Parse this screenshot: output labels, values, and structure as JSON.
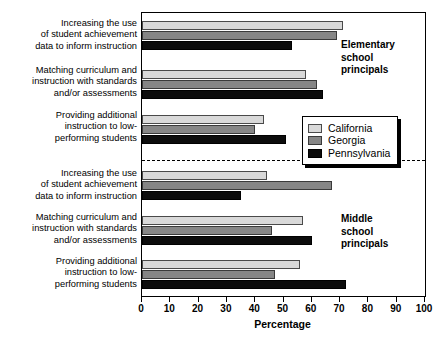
{
  "chart_data": {
    "type": "bar",
    "orientation": "horizontal",
    "title": "",
    "xlabel": "Percentage",
    "ylabel": "",
    "xlim": [
      0,
      100
    ],
    "xticks": [
      0,
      10,
      20,
      30,
      40,
      50,
      60,
      70,
      80,
      90,
      100
    ],
    "grid": false,
    "legend_position": "middle-right",
    "legend_entries": [
      "California",
      "Georgia",
      "Pennsylvania"
    ],
    "series": [
      {
        "name": "California",
        "color": "#d9d9d9",
        "values": [
          71,
          58,
          43,
          44,
          57,
          56
        ]
      },
      {
        "name": "Georgia",
        "color": "#868686",
        "values": [
          69,
          62,
          40,
          67,
          46,
          47
        ]
      },
      {
        "name": "Pennsylvania",
        "color": "#0c0c0c",
        "values": [
          53,
          64,
          51,
          35,
          60,
          72
        ]
      }
    ],
    "panels": [
      {
        "annotation": "Elementary school principals",
        "categories": [
          "Increasing the use of student achievement data to inform instruction",
          "Matching curriculum and instruction with standards and/or assessments",
          "Providing additional instruction to low-performing students"
        ]
      },
      {
        "annotation": "Middle school principals",
        "categories": [
          "Increasing the use of student achievement data to inform instruction",
          "Matching curriculum and instruction with standards and/or assessments",
          "Providing additional instruction to low-performing students"
        ]
      }
    ],
    "categories": [
      "Increasing the use of student achievement data to inform instruction",
      "Matching curriculum and instruction with standards and/or assessments",
      "Providing additional instruction to low-performing students",
      "Increasing the use of student achievement data to inform instruction",
      "Matching curriculum and instruction with standards and/or assessments",
      "Providing additional instruction to low-performing students"
    ]
  },
  "labels": {
    "cat1_line1": "Increasing the use",
    "cat1_line2": "of student achievement",
    "cat1_line3": "data to inform instruction",
    "cat2_line1": "Matching curriculum and",
    "cat2_line2": "instruction with standards",
    "cat2_line3": "and/or assessments",
    "cat3_line1": "Providing additional",
    "cat3_line2": "instruction to low-",
    "cat3_line3": "performing students",
    "cat4_line1": "Increasing the use",
    "cat4_line2": "of student achievement",
    "cat4_line3": "data to inform instruction",
    "cat5_line1": "Matching curriculum and",
    "cat5_line2": "instruction with standards",
    "cat5_line3": "and/or assessments",
    "cat6_line1": "Providing additional",
    "cat6_line2": "instruction to low-",
    "cat6_line3": "performing students"
  },
  "annotations": {
    "elementary_line1": "Elementary",
    "elementary_line2": "school",
    "elementary_line3": "principals",
    "middle_line1": "Middle",
    "middle_line2": "school",
    "middle_line3": "principals"
  },
  "legend": {
    "california": "California",
    "georgia": "Georgia",
    "pennsylvania": "Pennsylvania"
  },
  "axis": {
    "title": "Percentage",
    "t0": "0",
    "t1": "10",
    "t2": "20",
    "t3": "30",
    "t4": "40",
    "t5": "50",
    "t6": "60",
    "t7": "70",
    "t8": "80",
    "t9": "90",
    "t10": "100"
  }
}
